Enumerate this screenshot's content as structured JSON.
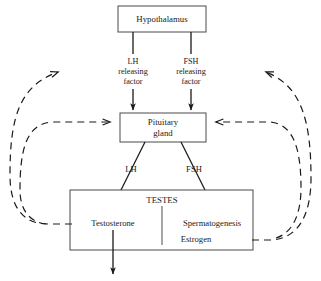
{
  "diagram": {
    "colors": {
      "box_stroke": "#4a4a4a",
      "line": "#1a1a1a",
      "background": "#ffffff",
      "divider": "#6a6a6a"
    },
    "nodes": {
      "hypothalamus": {
        "label": "Hypothalamus"
      },
      "lh_releasing_factor": {
        "line1": "LH",
        "line2": "releasing",
        "line3": "factor"
      },
      "fsh_releasing_factor": {
        "line1": "FSH",
        "line2": "releasing",
        "line3": "factor"
      },
      "pituitary": {
        "line1": "Pituitary",
        "line2": "gland"
      },
      "lh_label": {
        "label": "LH"
      },
      "fsh_label": {
        "label": "FSH"
      },
      "testes": {
        "label": "TESTES"
      },
      "testosterone": {
        "label": "Testosterone"
      },
      "spermatogenesis": {
        "label": "Spermatogenesis"
      },
      "estrogen": {
        "label": "Estrogen"
      }
    },
    "edges": [
      {
        "name": "hypothalamus-to-lh-rf",
        "style": "solid",
        "from": "hypothalamus",
        "to": "lh_releasing_factor"
      },
      {
        "name": "hypothalamus-to-fsh-rf",
        "style": "solid",
        "from": "hypothalamus",
        "to": "fsh_releasing_factor"
      },
      {
        "name": "lh-rf-to-pituitary",
        "style": "solid-arrow",
        "from": "lh_releasing_factor",
        "to": "pituitary"
      },
      {
        "name": "fsh-rf-to-pituitary",
        "style": "solid-arrow",
        "from": "fsh_releasing_factor",
        "to": "pituitary"
      },
      {
        "name": "pituitary-to-testosterone",
        "style": "solid-arrow",
        "from": "pituitary",
        "to": "testosterone"
      },
      {
        "name": "pituitary-to-spermatogenesis",
        "style": "solid-arrow",
        "from": "pituitary",
        "to": "spermatogenesis"
      },
      {
        "name": "testosterone-output",
        "style": "solid-arrow",
        "from": "testosterone",
        "to": "output"
      },
      {
        "name": "testosterone-feedback-to-lh-rf",
        "style": "dashed-arrow",
        "from": "testosterone",
        "to": "lh_releasing_factor"
      },
      {
        "name": "testosterone-feedback-to-pituitary",
        "style": "dashed-arrow",
        "from": "testosterone",
        "to": "pituitary"
      },
      {
        "name": "estrogen-feedback-to-fsh-rf",
        "style": "dashed-arrow",
        "from": "estrogen",
        "to": "fsh_releasing_factor"
      },
      {
        "name": "estrogen-feedback-to-pituitary",
        "style": "dashed-arrow",
        "from": "estrogen",
        "to": "pituitary"
      }
    ]
  }
}
